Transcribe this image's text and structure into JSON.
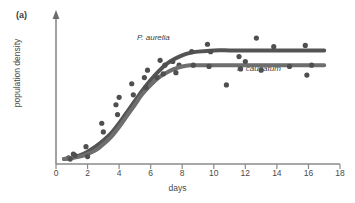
{
  "figure": {
    "panel_label": "(a)",
    "background_color": "#ffffff",
    "axis_color": "#808080",
    "ink_color": "#595959",
    "point_color": "#4f4f4f"
  },
  "chart_data": {
    "type": "line",
    "title": "",
    "subtitle": "",
    "panel": "(a)",
    "xlabel": "days",
    "ylabel": "population density",
    "xlim": [
      0,
      18
    ],
    "ylim": [
      0,
      1.15
    ],
    "xticks": [
      0,
      2,
      4,
      6,
      8,
      10,
      12,
      14,
      16,
      18
    ],
    "xtick_labels": [
      "0",
      "2",
      "4",
      "6",
      "8",
      "10",
      "12",
      "14",
      "16",
      "18"
    ],
    "yticks": [],
    "ytick_labels": [],
    "grid": false,
    "y_axis_has_arrow": true,
    "y_axis_numeric_scale": false,
    "legend": "inline-annotations",
    "legend_position": "inline",
    "annotations": [
      {
        "text": "P. aurelia",
        "x": 6.6,
        "y": 0.86,
        "style": "italic"
      },
      {
        "text": "P. caudatum",
        "x": 11.6,
        "y": 0.52,
        "style": "italic"
      }
    ],
    "series": [
      {
        "name": "P. aurelia",
        "kind": "fitted-logistic-curve",
        "color": "#545454",
        "line_width": 4,
        "x": [
          0.5,
          1,
          1.5,
          2,
          2.5,
          3,
          3.5,
          4,
          4.5,
          5,
          5.5,
          6,
          6.5,
          7,
          7.5,
          8,
          8.5,
          9,
          10,
          11,
          12,
          13,
          14,
          15,
          16,
          17
        ],
        "y": [
          0.04,
          0.05,
          0.07,
          0.1,
          0.14,
          0.19,
          0.25,
          0.33,
          0.42,
          0.51,
          0.6,
          0.68,
          0.75,
          0.81,
          0.85,
          0.88,
          0.9,
          0.91,
          0.92,
          0.92,
          0.92,
          0.92,
          0.92,
          0.92,
          0.92,
          0.92
        ],
        "points_x": [
          0.8,
          1.1,
          1.9,
          2.9,
          3.8,
          4.0,
          4.8,
          5.6,
          5.8,
          6.6,
          6.9,
          7.4,
          7.8,
          8.6,
          9.6,
          9.8,
          11.6,
          12.7,
          13.8,
          15.8
        ],
        "points_y": [
          0.05,
          0.08,
          0.14,
          0.33,
          0.48,
          0.54,
          0.65,
          0.7,
          0.76,
          0.84,
          0.8,
          0.83,
          0.8,
          0.91,
          0.97,
          0.91,
          0.87,
          1.02,
          0.95,
          0.96
        ]
      },
      {
        "name": "P. caudatum",
        "kind": "fitted-logistic-curve",
        "color": "#6e6e6e",
        "line_width": 4,
        "x": [
          0.5,
          1,
          1.5,
          2,
          2.5,
          3,
          3.5,
          4,
          4.5,
          5,
          5.5,
          6,
          6.5,
          7,
          7.5,
          8,
          8.5,
          9,
          10,
          11,
          12,
          13,
          14,
          15,
          16,
          17
        ],
        "y": [
          0.04,
          0.05,
          0.06,
          0.08,
          0.11,
          0.16,
          0.22,
          0.3,
          0.39,
          0.48,
          0.57,
          0.64,
          0.7,
          0.74,
          0.77,
          0.79,
          0.8,
          0.8,
          0.8,
          0.8,
          0.8,
          0.8,
          0.8,
          0.8,
          0.8,
          0.8
        ],
        "points_x": [
          0.9,
          1.2,
          2.0,
          3.0,
          3.9,
          4.9,
          5.7,
          6.4,
          6.8,
          7.6,
          8.7,
          9.7,
          10.8,
          11.7,
          12.0,
          13.0,
          14.8,
          15.9,
          16.2
        ],
        "points_y": [
          0.04,
          0.07,
          0.06,
          0.26,
          0.4,
          0.56,
          0.62,
          0.7,
          0.73,
          0.74,
          0.8,
          0.79,
          0.64,
          0.77,
          0.83,
          0.76,
          0.79,
          0.72,
          0.8
        ]
      }
    ]
  }
}
